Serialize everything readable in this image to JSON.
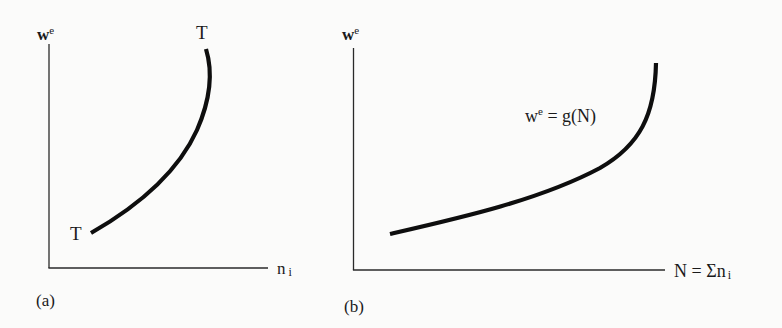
{
  "figure": {
    "panels": [
      {
        "id": "a",
        "caption": "(a)",
        "y_axis_label": {
          "base": "w",
          "sup": "e"
        },
        "x_axis_label": {
          "base": "n",
          "sub": "i"
        },
        "curve_labels": {
          "top": "T",
          "bottom": "T"
        }
      },
      {
        "id": "b",
        "caption": "(b)",
        "y_axis_label": {
          "base": "w",
          "sup": "e"
        },
        "x_axis_label": {
          "prefix": "N = Σn",
          "sub": "i"
        },
        "curve_equation": {
          "base": "w",
          "sup": "e",
          "rest": " = g(N)"
        }
      }
    ]
  }
}
